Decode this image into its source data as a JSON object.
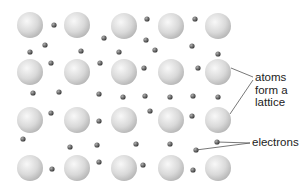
{
  "diagram": {
    "labels": {
      "atoms": "atoms\nform a\nlattice",
      "electrons": "electrons"
    },
    "colors": {
      "atom_fill_light": "#f4f4f4",
      "atom_fill_dark": "#bdbdbd",
      "electron_fill_light": "#9a9a9a",
      "electron_fill_dark": "#3c3c3c",
      "leader_line": "#555555",
      "text": "#222222"
    },
    "atom_radius": 13,
    "electron_radius": 2.6,
    "atoms": [
      {
        "x": 30,
        "y": 25
      },
      {
        "x": 77,
        "y": 25
      },
      {
        "x": 124,
        "y": 26
      },
      {
        "x": 171,
        "y": 26
      },
      {
        "x": 218,
        "y": 26
      },
      {
        "x": 30,
        "y": 72
      },
      {
        "x": 77,
        "y": 72
      },
      {
        "x": 124,
        "y": 72
      },
      {
        "x": 171,
        "y": 72
      },
      {
        "x": 218,
        "y": 72
      },
      {
        "x": 30,
        "y": 120
      },
      {
        "x": 77,
        "y": 120
      },
      {
        "x": 124,
        "y": 120
      },
      {
        "x": 171,
        "y": 120
      },
      {
        "x": 218,
        "y": 120
      },
      {
        "x": 30,
        "y": 168
      },
      {
        "x": 77,
        "y": 168
      },
      {
        "x": 124,
        "y": 168
      },
      {
        "x": 171,
        "y": 168
      },
      {
        "x": 218,
        "y": 168
      }
    ],
    "electrons": [
      {
        "x": 54,
        "y": 25
      },
      {
        "x": 104,
        "y": 38
      },
      {
        "x": 147,
        "y": 19
      },
      {
        "x": 195,
        "y": 19
      },
      {
        "x": 45,
        "y": 45
      },
      {
        "x": 30,
        "y": 52
      },
      {
        "x": 81,
        "y": 51
      },
      {
        "x": 119,
        "y": 52
      },
      {
        "x": 146,
        "y": 40
      },
      {
        "x": 155,
        "y": 50
      },
      {
        "x": 192,
        "y": 46
      },
      {
        "x": 218,
        "y": 54
      },
      {
        "x": 51,
        "y": 63
      },
      {
        "x": 100,
        "y": 63
      },
      {
        "x": 144,
        "y": 68
      },
      {
        "x": 198,
        "y": 68
      },
      {
        "x": 33,
        "y": 93
      },
      {
        "x": 59,
        "y": 92
      },
      {
        "x": 99,
        "y": 94
      },
      {
        "x": 123,
        "y": 97
      },
      {
        "x": 145,
        "y": 96
      },
      {
        "x": 170,
        "y": 97
      },
      {
        "x": 193,
        "y": 96
      },
      {
        "x": 218,
        "y": 97
      },
      {
        "x": 51,
        "y": 113
      },
      {
        "x": 99,
        "y": 121
      },
      {
        "x": 150,
        "y": 111
      },
      {
        "x": 192,
        "y": 116
      },
      {
        "x": 23,
        "y": 139
      },
      {
        "x": 70,
        "y": 147
      },
      {
        "x": 97,
        "y": 145
      },
      {
        "x": 136,
        "y": 144
      },
      {
        "x": 170,
        "y": 144
      },
      {
        "x": 196,
        "y": 150
      },
      {
        "x": 217,
        "y": 142
      },
      {
        "x": 52,
        "y": 169
      },
      {
        "x": 99,
        "y": 162
      },
      {
        "x": 143,
        "y": 165
      },
      {
        "x": 193,
        "y": 170
      }
    ],
    "leaders": {
      "atoms": [
        {
          "x1": 231,
          "y1": 68,
          "x2": 253,
          "y2": 77
        },
        {
          "x1": 230,
          "y1": 114,
          "x2": 253,
          "y2": 80
        }
      ],
      "electrons": [
        {
          "x1": 217,
          "y1": 142,
          "x2": 250,
          "y2": 143
        },
        {
          "x1": 196,
          "y1": 150,
          "x2": 250,
          "y2": 143
        }
      ]
    }
  }
}
